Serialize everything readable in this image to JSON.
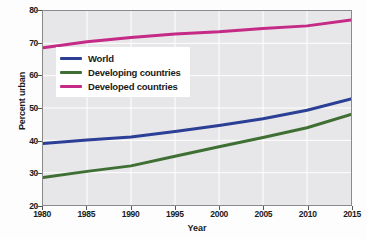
{
  "chart_data": {
    "type": "line",
    "title": "",
    "xlabel": "Year",
    "ylabel": "Percent urban",
    "xlim": [
      1980,
      2015
    ],
    "ylim": [
      20,
      80
    ],
    "grid": true,
    "legend_position": "upper-left-inside",
    "x_ticks": [
      1980,
      1985,
      1990,
      1995,
      2000,
      2005,
      2010,
      2015
    ],
    "y_ticks": [
      20,
      30,
      40,
      50,
      60,
      70,
      80
    ],
    "x": [
      1980,
      1985,
      1990,
      1995,
      2000,
      2005,
      2010,
      2015
    ],
    "series": [
      {
        "name": "World",
        "color": "#2b3f96",
        "values": [
          39.0,
          40.1,
          41.0,
          42.7,
          44.6,
          46.7,
          49.3,
          52.8
        ]
      },
      {
        "name": "Developing countries",
        "color": "#3f6f33",
        "values": [
          28.5,
          30.4,
          32.1,
          35.1,
          38.0,
          40.9,
          43.9,
          48.0
        ]
      },
      {
        "name": "Developed countries",
        "color": "#c42a86",
        "values": [
          68.6,
          70.5,
          71.8,
          72.9,
          73.6,
          74.6,
          75.4,
          77.2
        ]
      }
    ]
  },
  "legend": {
    "entries": [
      {
        "label": "World",
        "color": "#2b3f96"
      },
      {
        "label": "Developing countries",
        "color": "#3f6f33"
      },
      {
        "label": "Developed countries",
        "color": "#c42a86"
      }
    ]
  },
  "axes": {
    "y_title": "Percent urban",
    "x_title": "Year",
    "y_tick_labels": [
      "80",
      "70",
      "60",
      "50",
      "40",
      "30",
      "20"
    ],
    "x_tick_labels": [
      "1980",
      "1985",
      "1990",
      "1995",
      "2000",
      "2005",
      "2010",
      "2015"
    ]
  },
  "style": {
    "plot_background": "#e7e7e9",
    "gridline_color": "#ffffff",
    "frame_color": "#8a8a8a",
    "page_background": "#fdfdfd"
  }
}
